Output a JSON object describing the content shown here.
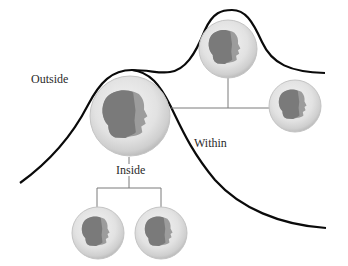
{
  "diagram": {
    "labels": {
      "outside": "Outside",
      "inside": "Inside",
      "within": "Within"
    },
    "nodes": [
      {
        "id": "self",
        "role": "central-person",
        "cx": 130,
        "cy": 116,
        "r": 40
      },
      {
        "id": "top",
        "role": "person-outside-peak",
        "cx": 228,
        "cy": 49,
        "r": 29
      },
      {
        "id": "right",
        "role": "person-within",
        "cx": 295,
        "cy": 106,
        "r": 26
      },
      {
        "id": "bottom-left",
        "role": "person-inside-1",
        "cx": 98,
        "cy": 233,
        "r": 26
      },
      {
        "id": "bottom-right",
        "role": "person-inside-2",
        "cx": 161,
        "cy": 233,
        "r": 26
      }
    ],
    "colors": {
      "curve": "#0a0a0a",
      "connector": "#7a7a7a",
      "sphere_outer": "#d8d8d8",
      "sphere_rim": "#b9b9b9",
      "head_dark": "#7b7b7b",
      "head_light": "#9a9a9a",
      "label_text": "#2a2a2a"
    }
  }
}
